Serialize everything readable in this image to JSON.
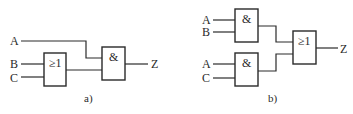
{
  "diagrams": {
    "a": {
      "caption": "a)",
      "inputs": {
        "A": "A",
        "B": "B",
        "C": "C"
      },
      "gates": {
        "or_gate": "≥1",
        "and_gate": "&"
      },
      "output": "Z"
    },
    "b": {
      "caption": "b)",
      "inputs": {
        "A1": "A",
        "B": "B",
        "A2": "A",
        "C": "C"
      },
      "gates": {
        "and_top": "&",
        "and_bottom": "&",
        "or_gate": "≥1"
      },
      "output": "Z"
    }
  },
  "colors": {
    "stroke": "#2a2a2a",
    "background": "#ffffff"
  }
}
